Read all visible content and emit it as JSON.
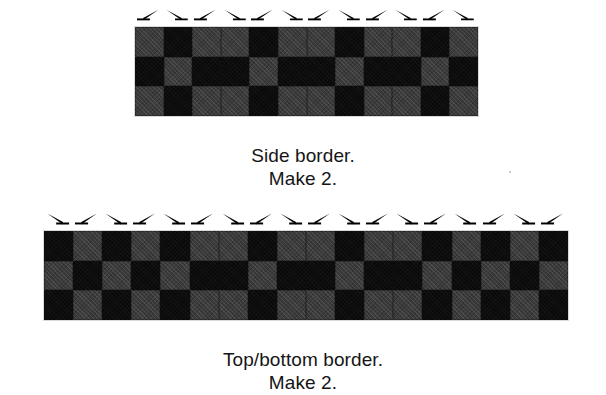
{
  "page": {
    "background": "#ffffff",
    "width": 606,
    "height": 395
  },
  "colors": {
    "dark_fabric": "#0a0a0a",
    "gray_fabric": "#3b3b3b",
    "text": "#151515",
    "arrow": "#000000"
  },
  "figures": [
    {
      "id": "side-border",
      "name": "side-border-figure",
      "quilt": {
        "left": 134,
        "top": 26,
        "width": 343,
        "height": 89,
        "columns": 12,
        "rows": 3,
        "pattern": [
          [
            "gray",
            "dark",
            "gray",
            "gray",
            "dark",
            "gray",
            "gray",
            "dark",
            "gray",
            "gray",
            "dark",
            "gray"
          ],
          [
            "dark",
            "gray",
            "dark",
            "dark",
            "gray",
            "dark",
            "dark",
            "gray",
            "dark",
            "dark",
            "gray",
            "dark"
          ],
          [
            "gray",
            "dark",
            "gray",
            "gray",
            "dark",
            "gray",
            "gray",
            "dark",
            "gray",
            "gray",
            "dark",
            "gray"
          ]
        ]
      },
      "arrows": {
        "count": 12,
        "directions": [
          "right",
          "left",
          "right",
          "left",
          "right",
          "left",
          "right",
          "left",
          "right",
          "left",
          "right",
          "left"
        ]
      },
      "caption": {
        "line1": "Side border.",
        "line2": "Make 2."
      }
    },
    {
      "id": "top-bottom-border",
      "name": "top-bottom-border-figure",
      "quilt": {
        "left": 43,
        "top": 230,
        "width": 524,
        "height": 89,
        "columns": 18,
        "rows": 3,
        "pattern": [
          [
            "dark",
            "gray",
            "dark",
            "gray",
            "dark",
            "gray",
            "gray",
            "dark",
            "gray",
            "gray",
            "dark",
            "gray",
            "gray",
            "dark",
            "gray",
            "dark",
            "gray",
            "dark"
          ],
          [
            "gray",
            "dark",
            "gray",
            "dark",
            "gray",
            "dark",
            "dark",
            "gray",
            "dark",
            "dark",
            "gray",
            "dark",
            "dark",
            "gray",
            "dark",
            "gray",
            "dark",
            "gray"
          ],
          [
            "dark",
            "gray",
            "dark",
            "gray",
            "dark",
            "gray",
            "gray",
            "dark",
            "gray",
            "gray",
            "dark",
            "gray",
            "gray",
            "dark",
            "gray",
            "dark",
            "gray",
            "dark"
          ]
        ]
      },
      "arrows": {
        "count": 18,
        "directions": [
          "left",
          "right",
          "left",
          "right",
          "left",
          "right",
          "left",
          "right",
          "left",
          "right",
          "left",
          "right",
          "left",
          "right",
          "left",
          "right",
          "left",
          "right"
        ]
      },
      "caption": {
        "line1": "Top/bottom border.",
        "line2": "Make 2."
      }
    }
  ]
}
